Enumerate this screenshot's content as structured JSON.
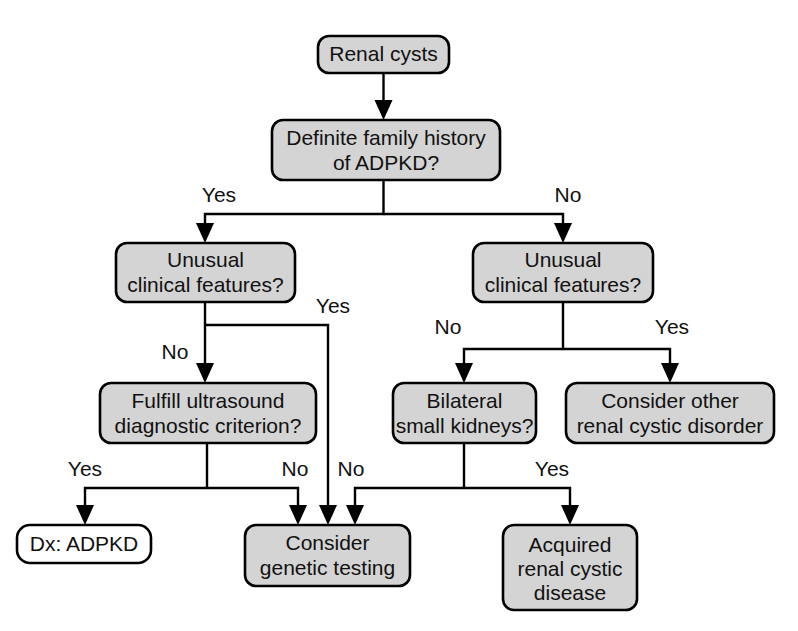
{
  "diagram": {
    "type": "flowchart",
    "colors": {
      "node_fill": "#d4d4d4",
      "node_fill_plain": "#ffffff",
      "stroke": "#000000",
      "text": "#111111",
      "background": "#ffffff"
    },
    "nodes": [
      {
        "id": "renal-cysts",
        "lines": [
          "Renal cysts"
        ],
        "style": "filled",
        "x": 318,
        "y": 36,
        "w": 131,
        "h": 37
      },
      {
        "id": "definite-family-history",
        "lines": [
          "Definite family history",
          "of ADPKD?"
        ],
        "style": "filled",
        "x": 272,
        "y": 120,
        "w": 228,
        "h": 60
      },
      {
        "id": "unusual-clinical-features-left",
        "lines": [
          "Unusual",
          "clinical features?"
        ],
        "style": "filled",
        "x": 116,
        "y": 243,
        "w": 179,
        "h": 59
      },
      {
        "id": "unusual-clinical-features-right",
        "lines": [
          "Unusual",
          "clinical features?"
        ],
        "style": "filled",
        "x": 473,
        "y": 243,
        "w": 180,
        "h": 59
      },
      {
        "id": "fulfill-ultrasound-criterion",
        "lines": [
          "Fulfill ultrasound",
          "diagnostic criterion?"
        ],
        "style": "filled",
        "x": 100,
        "y": 383,
        "w": 216,
        "h": 60
      },
      {
        "id": "bilateral-small-kidneys",
        "lines": [
          "Bilateral",
          "small kidneys?"
        ],
        "style": "filled",
        "x": 393,
        "y": 383,
        "w": 143,
        "h": 60
      },
      {
        "id": "consider-other-renal-cystic-disorder",
        "lines": [
          "Consider other",
          "renal cystic disorder"
        ],
        "style": "filled",
        "x": 566,
        "y": 383,
        "w": 208,
        "h": 60
      },
      {
        "id": "dx-adpkd",
        "lines": [
          "Dx: ADPKD"
        ],
        "style": "plain",
        "x": 17,
        "y": 525,
        "w": 134,
        "h": 38
      },
      {
        "id": "consider-genetic-testing",
        "lines": [
          "Consider",
          "genetic testing"
        ],
        "style": "filled",
        "x": 245,
        "y": 525,
        "w": 165,
        "h": 61
      },
      {
        "id": "acquired-renal-cystic-disease",
        "lines": [
          "Acquired",
          "renal cystic",
          "disease"
        ],
        "style": "filled",
        "x": 503,
        "y": 525,
        "w": 134,
        "h": 85
      }
    ],
    "edges": [
      {
        "id": "e1",
        "from": "renal-cysts",
        "to": "definite-family-history",
        "label": ""
      },
      {
        "id": "e2",
        "from": "definite-family-history",
        "to": "unusual-clinical-features-left",
        "label": "Yes",
        "label_x": 219,
        "label_y": 196
      },
      {
        "id": "e3",
        "from": "definite-family-history",
        "to": "unusual-clinical-features-right",
        "label": "No",
        "label_x": 568,
        "label_y": 196
      },
      {
        "id": "e4",
        "from": "unusual-clinical-features-left",
        "to": "fulfill-ultrasound-criterion",
        "label": "No",
        "label_x": 175,
        "label_y": 353
      },
      {
        "id": "e5",
        "from": "unusual-clinical-features-left",
        "to": "consider-genetic-testing",
        "label": "Yes",
        "label_x": 333,
        "label_y": 330
      },
      {
        "id": "e6",
        "from": "unusual-clinical-features-right",
        "to": "bilateral-small-kidneys",
        "label": "No",
        "label_x": 448,
        "label_y": 328
      },
      {
        "id": "e7",
        "from": "unusual-clinical-features-right",
        "to": "consider-other-renal-cystic-disorder",
        "label": "Yes",
        "label_x": 672,
        "label_y": 328
      },
      {
        "id": "e8",
        "from": "fulfill-ultrasound-criterion",
        "to": "dx-adpkd",
        "label": "Yes",
        "label_x": 85,
        "label_y": 470
      },
      {
        "id": "e9",
        "from": "fulfill-ultrasound-criterion",
        "to": "consider-genetic-testing",
        "label": "No",
        "label_x": 295,
        "label_y": 470
      },
      {
        "id": "e10",
        "from": "bilateral-small-kidneys",
        "to": "consider-genetic-testing",
        "label": "No",
        "label_x": 351,
        "label_y": 470
      },
      {
        "id": "e11",
        "from": "bilateral-small-kidneys",
        "to": "acquired-renal-cystic-disease",
        "label": "Yes",
        "label_x": 552,
        "label_y": 470
      }
    ],
    "labels": {
      "yes": "Yes",
      "no": "No"
    }
  }
}
